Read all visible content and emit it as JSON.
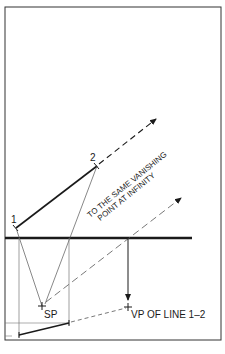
{
  "diagram": {
    "colors": {
      "ink": "#1a1a1a",
      "thin": "#555555",
      "background": "#ffffff"
    },
    "labels": {
      "point1": "1",
      "point2": "2",
      "station_point": "SP",
      "vanishing_point": "VP OF LINE 1–2",
      "annotation_line1": "TO THE SAME VANISHING",
      "annotation_line2": "POINT AT INFINITY"
    },
    "elements": {
      "frame": "border",
      "horizon_line": "picture plane / horizon",
      "line_1_2": "solid line from 1 to 2",
      "projection_1_2": "dashed extension to infinity",
      "sp_parallel": "dashed line from SP parallel to 1-2",
      "vp_drop": "vertical arrow to VP",
      "plan_segment": "plan view of line 1-2"
    }
  }
}
